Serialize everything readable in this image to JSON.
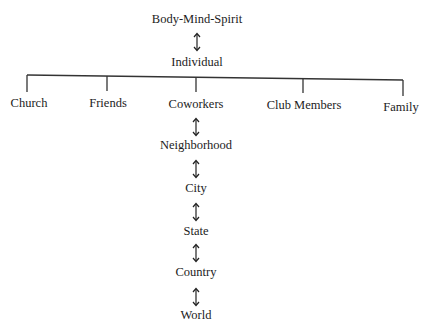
{
  "diagram": {
    "title": "Body-Mind-Spirit",
    "center": "Individual",
    "branches": [
      "Church",
      "Friends",
      "Coworkers",
      "Club  Members",
      "Family"
    ],
    "chain": [
      "Neighborhood",
      "City",
      "State",
      "Country",
      "World"
    ],
    "connector": "bidirectional-arrow",
    "line_color": "#333333",
    "text_color": "#1c1c1c"
  }
}
